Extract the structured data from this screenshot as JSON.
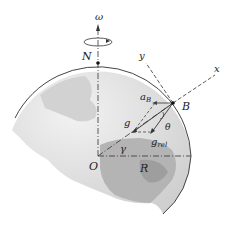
{
  "diagram": {
    "labels": {
      "omega": "ω",
      "north": "N",
      "y_axis": "y",
      "x_axis": "x",
      "a_B": "a",
      "a_B_sub": "B",
      "point_B": "B",
      "g": "g",
      "theta": "θ",
      "g_rel": "g",
      "g_rel_sub": "rel",
      "gamma": "γ",
      "origin": "O",
      "radius": "R"
    },
    "colors": {
      "globe_light": "#e4e4e4",
      "globe_mid": "#c8c8c8",
      "globe_dark": "#a9a9a9",
      "line": "#333333"
    }
  }
}
